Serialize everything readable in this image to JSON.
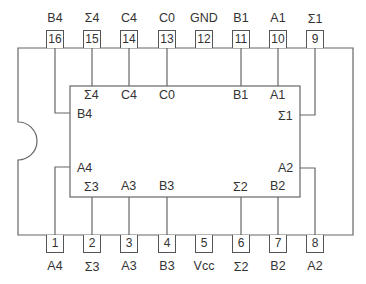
{
  "diagram": {
    "title": "",
    "type": "IC pinout (16-pin DIP, 4-bit binary full adder)",
    "line_color": "#666666",
    "top_pins": [
      {
        "number": "16",
        "label": "B4",
        "inner": "B4"
      },
      {
        "number": "15",
        "label": "Σ4",
        "inner": "Σ4"
      },
      {
        "number": "14",
        "label": "C4",
        "inner": "C4"
      },
      {
        "number": "13",
        "label": "C0",
        "inner": "C0"
      },
      {
        "number": "12",
        "label": "GND",
        "inner": ""
      },
      {
        "number": "11",
        "label": "B1",
        "inner": "B1"
      },
      {
        "number": "10",
        "label": "A1",
        "inner": "A1"
      },
      {
        "number": "9",
        "label": "Σ1",
        "inner": "Σ1"
      }
    ],
    "bottom_pins": [
      {
        "number": "1",
        "label": "A4",
        "inner": "A4"
      },
      {
        "number": "2",
        "label": "Σ3",
        "inner": "Σ3"
      },
      {
        "number": "3",
        "label": "A3",
        "inner": "A3"
      },
      {
        "number": "4",
        "label": "B3",
        "inner": "B3"
      },
      {
        "number": "5",
        "label": "Vcc",
        "inner": ""
      },
      {
        "number": "6",
        "label": "Σ2",
        "inner": "Σ2"
      },
      {
        "number": "7",
        "label": "B2",
        "inner": "B2"
      },
      {
        "number": "8",
        "label": "A2",
        "inner": "A2"
      }
    ]
  }
}
